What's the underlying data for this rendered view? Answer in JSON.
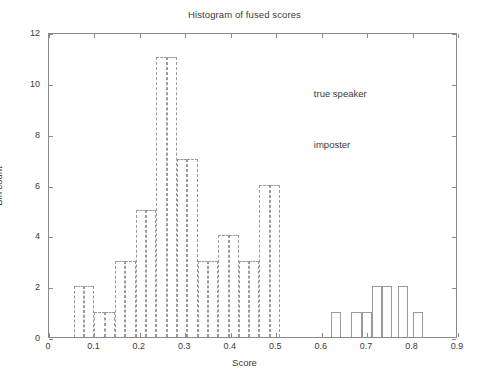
{
  "chart_data": {
    "type": "bar",
    "title": "Histogram of fused scores",
    "xlabel": "Score",
    "ylabel": "Bin count",
    "xlim": [
      0,
      0.9
    ],
    "ylim": [
      0,
      12
    ],
    "grid": false,
    "legend_position": "in-plot annotations",
    "x_ticks": [
      "0",
      "0.1",
      "0.2",
      "0.3",
      "0.4",
      "0.5",
      "0.6",
      "0.7",
      "0.8",
      "0.9"
    ],
    "x_tick_values": [
      0,
      0.1,
      0.2,
      0.3,
      0.4,
      0.5,
      0.6,
      0.7,
      0.8,
      0.9
    ],
    "y_ticks": [
      "0",
      "2",
      "4",
      "6",
      "8",
      "10",
      "12"
    ],
    "y_tick_values": [
      0,
      2,
      4,
      6,
      8,
      10,
      12
    ],
    "bin_width": 0.0227,
    "annotations": [
      {
        "text": "true speaker",
        "x": 0.585,
        "y": 9.6
      },
      {
        "text": "imposter",
        "x": 0.585,
        "y": 7.6
      }
    ],
    "series": [
      {
        "name": "imposter",
        "style": "dashed-outline",
        "color": "#9a9a9a",
        "bins": [
          {
            "x0": 0.0545,
            "x1": 0.0772,
            "value": 2
          },
          {
            "x0": 0.0772,
            "x1": 0.0999,
            "value": 2
          },
          {
            "x0": 0.0999,
            "x1": 0.1226,
            "value": 1
          },
          {
            "x0": 0.1226,
            "x1": 0.1453,
            "value": 1
          },
          {
            "x0": 0.1453,
            "x1": 0.168,
            "value": 3
          },
          {
            "x0": 0.168,
            "x1": 0.1907,
            "value": 3
          },
          {
            "x0": 0.1907,
            "x1": 0.2134,
            "value": 5
          },
          {
            "x0": 0.2134,
            "x1": 0.2361,
            "value": 5
          },
          {
            "x0": 0.2361,
            "x1": 0.2588,
            "value": 11
          },
          {
            "x0": 0.2588,
            "x1": 0.2815,
            "value": 11
          },
          {
            "x0": 0.2815,
            "x1": 0.3042,
            "value": 7
          },
          {
            "x0": 0.3042,
            "x1": 0.3269,
            "value": 7
          },
          {
            "x0": 0.3269,
            "x1": 0.3496,
            "value": 3
          },
          {
            "x0": 0.3496,
            "x1": 0.3723,
            "value": 3
          },
          {
            "x0": 0.3723,
            "x1": 0.395,
            "value": 4
          },
          {
            "x0": 0.395,
            "x1": 0.4177,
            "value": 4
          },
          {
            "x0": 0.4177,
            "x1": 0.4404,
            "value": 3
          },
          {
            "x0": 0.4404,
            "x1": 0.4631,
            "value": 3
          },
          {
            "x0": 0.4631,
            "x1": 0.4858,
            "value": 6
          },
          {
            "x0": 0.4858,
            "x1": 0.5085,
            "value": 6
          }
        ]
      },
      {
        "name": "true speaker",
        "style": "solid-outline",
        "color": "#9a9a9a",
        "bins": [
          {
            "x0": 0.62,
            "x1": 0.6427,
            "value": 1
          },
          {
            "x0": 0.665,
            "x1": 0.6877,
            "value": 1
          },
          {
            "x0": 0.6877,
            "x1": 0.7104,
            "value": 1
          },
          {
            "x0": 0.7104,
            "x1": 0.7331,
            "value": 2
          },
          {
            "x0": 0.7331,
            "x1": 0.7558,
            "value": 2
          },
          {
            "x0": 0.767,
            "x1": 0.7897,
            "value": 2
          },
          {
            "x0": 0.801,
            "x1": 0.8237,
            "value": 1
          }
        ]
      }
    ]
  }
}
